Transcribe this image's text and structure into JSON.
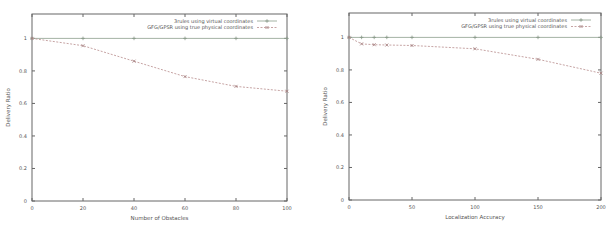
{
  "chart_data": [
    {
      "type": "line",
      "title": "",
      "xlabel": "Number of Obstacles",
      "ylabel": "Delivery Ratio",
      "xlim": [
        0,
        100
      ],
      "ylim": [
        0,
        1.15
      ],
      "xticks": [
        0,
        20,
        40,
        60,
        80,
        100
      ],
      "yticks": [
        0,
        0.2,
        0.4,
        0.6,
        0.8,
        1
      ],
      "grid": false,
      "legend_position": "top-right",
      "series": [
        {
          "name": "3rules using virtual coordinates",
          "style": "solid",
          "marker": "plus",
          "color": "#9aaa9a",
          "x": [
            0,
            20,
            40,
            60,
            80,
            100
          ],
          "y": [
            1.0,
            1.0,
            1.0,
            1.0,
            1.0,
            1.0
          ]
        },
        {
          "name": "GFG/GPSR using true physical coordinates",
          "style": "dashed",
          "marker": "x",
          "color": "#c09a9a",
          "x": [
            0,
            20,
            40,
            60,
            80,
            100
          ],
          "y": [
            1.0,
            0.955,
            0.86,
            0.765,
            0.705,
            0.675
          ]
        }
      ]
    },
    {
      "type": "line",
      "title": "",
      "xlabel": "Localization Accuracy",
      "ylabel": "Delivery Ratio",
      "xlim": [
        0,
        200
      ],
      "ylim": [
        0,
        1.15
      ],
      "xticks": [
        0,
        50,
        100,
        150,
        200
      ],
      "yticks": [
        0,
        0.2,
        0.4,
        0.6,
        0.8,
        1
      ],
      "grid": false,
      "legend_position": "top-right",
      "series": [
        {
          "name": "3rules using virtual coordinates",
          "style": "solid",
          "marker": "plus",
          "color": "#9aaa9a",
          "x": [
            0,
            10,
            20,
            30,
            50,
            100,
            150,
            200
          ],
          "y": [
            1.0,
            1.0,
            1.0,
            1.0,
            1.0,
            1.0,
            1.0,
            1.0
          ]
        },
        {
          "name": "GFG/GPSR using true physical coordinates",
          "style": "dashed",
          "marker": "x",
          "color": "#c09a9a",
          "x": [
            0,
            10,
            20,
            30,
            50,
            100,
            150,
            200
          ],
          "y": [
            1.0,
            0.96,
            0.955,
            0.953,
            0.95,
            0.93,
            0.865,
            0.78
          ]
        }
      ]
    }
  ],
  "layout": [
    {
      "left": 0,
      "plot": {
        "x0": 32,
        "x1": 287,
        "y0": 14,
        "y1": 201
      }
    },
    {
      "left": 305,
      "plot": {
        "x0": 44,
        "x1": 296,
        "y0": 13,
        "y1": 200
      }
    }
  ]
}
